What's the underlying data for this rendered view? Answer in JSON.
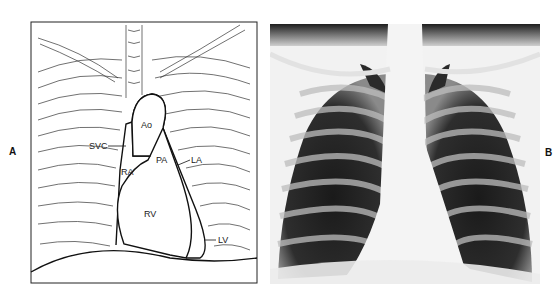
{
  "figure": {
    "panels": [
      {
        "label": "A",
        "type": "line-drawing",
        "structures": [
          {
            "abbr": "Ao"
          },
          {
            "abbr": "SVC"
          },
          {
            "abbr": "PA"
          },
          {
            "abbr": "LA"
          },
          {
            "abbr": "RA"
          },
          {
            "abbr": "RV"
          },
          {
            "abbr": "LV"
          }
        ]
      },
      {
        "label": "B",
        "type": "chest-radiograph"
      }
    ]
  },
  "colors": {
    "line": "#222222",
    "background": "#ffffff"
  }
}
